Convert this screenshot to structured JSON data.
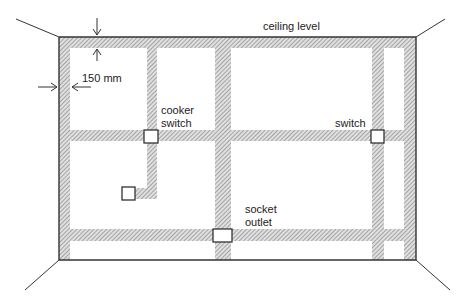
{
  "diagram": {
    "labels": {
      "ceiling": "ceiling level",
      "dimension": "150 mm",
      "cooker_switch": [
        "cooker",
        "switch"
      ],
      "switch": "switch",
      "socket_outlet": [
        "socket",
        "outlet"
      ]
    },
    "colors": {
      "line": "#333333",
      "zone_hatch": "#8c8c8c",
      "zone_fill": "#d9d9d9",
      "accessory_fill": "#ffffff"
    },
    "wall": {
      "x": 59,
      "y": 37,
      "width": 357,
      "height": 223
    },
    "zone_width_px": 11,
    "accessories": [
      {
        "name": "cooker-switch",
        "x": 144,
        "y": 130,
        "w": 14,
        "h": 13
      },
      {
        "name": "switch",
        "x": 371,
        "y": 130,
        "w": 13,
        "h": 13
      },
      {
        "name": "cooker-outlet",
        "x": 122,
        "y": 187,
        "w": 13,
        "h": 13
      },
      {
        "name": "socket-outlet",
        "x": 213,
        "y": 229,
        "w": 19,
        "h": 13
      }
    ]
  }
}
